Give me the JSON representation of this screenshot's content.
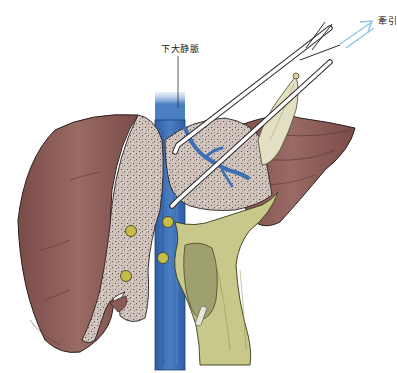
{
  "figure": {
    "type": "surgical-anatomy-illustration",
    "labels": {
      "ivc": "下大静脈",
      "traction": "牽引"
    },
    "colors": {
      "liver_surface": "#8a5a55",
      "liver_dark": "#6e4440",
      "cut_parenchyma": "#cfc2bb",
      "ivc_blue": "#3d6fb5",
      "ligament_green": "#c8c98a",
      "clip_yellow": "#c8b84a",
      "forceps_white": "#ffffff",
      "arrow_blue": "#8cc4e8",
      "outline": "#2a2020"
    }
  }
}
